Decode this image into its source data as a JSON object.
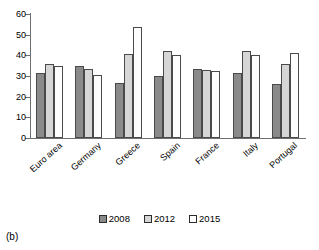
{
  "caption": "(b)",
  "legend": {
    "position": "bottom",
    "entries": [
      {
        "label": "2008",
        "color": "#8a8a8a",
        "icon": "legend-swatch-2008"
      },
      {
        "label": "2012",
        "color": "#d6d6d6",
        "icon": "legend-swatch-2012"
      },
      {
        "label": "2015",
        "color": "#ffffff",
        "icon": "legend-swatch-2015"
      }
    ]
  },
  "chart_data": {
    "type": "bar",
    "title": "",
    "subtitle": "",
    "xlabel": "",
    "ylabel": "",
    "ylim": [
      0,
      60
    ],
    "yticks": [
      0,
      10,
      20,
      30,
      40,
      50,
      60
    ],
    "grid": false,
    "legend_position": "bottom",
    "categories": [
      "Euro area",
      "Germany",
      "Greece",
      "Spain",
      "France",
      "Italy",
      "Portugal"
    ],
    "series": [
      {
        "name": "2008",
        "color": "#8a8a8a",
        "values": [
          31.5,
          35.0,
          26.5,
          30.0,
          33.5,
          31.5,
          26.0
        ]
      },
      {
        "name": "2012",
        "color": "#d6d6d6",
        "values": [
          36.0,
          33.5,
          40.5,
          42.0,
          33.0,
          42.0,
          36.0
        ]
      },
      {
        "name": "2015",
        "color": "#ffffff",
        "values": [
          35.0,
          30.5,
          53.5,
          40.0,
          32.5,
          40.0,
          41.0
        ]
      }
    ]
  }
}
